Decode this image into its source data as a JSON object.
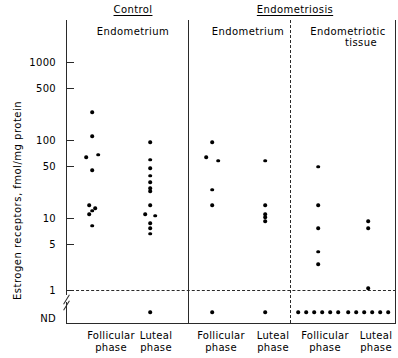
{
  "figure": {
    "y_axis_title": "Estrogen receptors, fmol/mg protein",
    "nd_label": "ND",
    "y_ticks": [
      "1000",
      "500",
      "100",
      "50",
      "10",
      "5",
      "1"
    ]
  },
  "top_headers": [
    {
      "label": "Control"
    },
    {
      "label": "Endometriosis"
    }
  ],
  "sub_headers": [
    {
      "label": "Endometrium"
    },
    {
      "label": "Endometrium"
    },
    {
      "label": "Endometriotic",
      "label2": "tissue"
    }
  ],
  "x_labels": [
    {
      "line1": "Follicular",
      "line2": "phase"
    },
    {
      "line1": "Luteal",
      "line2": "phase"
    },
    {
      "line1": "Follicular",
      "line2": "phase"
    },
    {
      "line1": "Luteal",
      "line2": "phase"
    },
    {
      "line1": "Follicular",
      "line2": "phase"
    },
    {
      "line1": "Luteal",
      "line2": "phase"
    }
  ],
  "colors": {
    "ink": "#000000",
    "rule": "#2a2a2a",
    "background": "#ffffff"
  },
  "chart_data": {
    "type": "scatter",
    "title": "",
    "xlabel": "",
    "ylabel": "Estrogen receptors, fmol/mg protein",
    "yscale": "log",
    "ylim": [
      1,
      1000
    ],
    "ytick_values": [
      1000,
      500,
      100,
      50,
      10,
      5,
      1
    ],
    "axis_break": {
      "between": [
        1,
        0
      ],
      "below_label": "ND"
    },
    "reference_line": {
      "value": 1,
      "style": "dashed"
    },
    "grid": false,
    "legend": null,
    "groups": [
      {
        "name": "Control / Endometrium / Follicular phase",
        "group": "Control",
        "tissue": "Endometrium",
        "phase": "Follicular phase",
        "values": [
          220,
          105,
          56,
          60,
          38,
          13,
          12,
          11,
          10,
          7
        ],
        "nd_count": 0
      },
      {
        "name": "Control / Endometrium / Luteal phase",
        "group": "Control",
        "tissue": "Endometrium",
        "phase": "Luteal phase",
        "values": [
          88,
          52,
          40,
          32,
          26,
          22,
          20,
          13,
          10,
          9.5,
          7.5,
          6.5,
          5.5
        ],
        "nd_count": 1
      },
      {
        "name": "Endometriosis / Endometrium / Follicular phase",
        "group": "Endometriosis",
        "tissue": "Endometrium",
        "phase": "Follicular phase",
        "values": [
          88,
          56,
          50,
          21,
          13
        ],
        "nd_count": 1
      },
      {
        "name": "Endometriosis / Endometrium / Luteal phase",
        "group": "Endometriosis",
        "tissue": "Endometrium",
        "phase": "Luteal phase",
        "values": [
          50,
          13,
          10,
          9,
          8
        ],
        "nd_count": 1
      },
      {
        "name": "Endometriosis / Endometriotic tissue / Follicular phase",
        "group": "Endometriosis",
        "tissue": "Endometriotic tissue",
        "phase": "Follicular phase",
        "values": [
          42,
          13,
          6.5,
          3.2,
          2.2
        ],
        "nd_count": 6
      },
      {
        "name": "Endometriosis / Endometriotic tissue / Luteal phase",
        "group": "Endometriosis",
        "tissue": "Endometriotic tissue",
        "phase": "Luteal phase",
        "values": [
          8,
          6.5,
          1.05
        ],
        "nd_count": 6
      }
    ]
  }
}
